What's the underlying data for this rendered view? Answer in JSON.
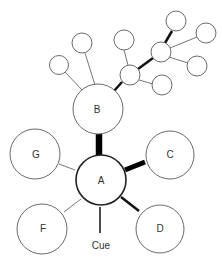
{
  "diagram": {
    "type": "network",
    "nodes": {
      "A": {
        "label": "A"
      },
      "B": {
        "label": "B"
      },
      "C": {
        "label": "C"
      },
      "D": {
        "label": "D"
      },
      "F": {
        "label": "F"
      },
      "G": {
        "label": "G"
      }
    },
    "cue_label": "Cue",
    "edges": [
      {
        "from": "A",
        "to": "B",
        "weight": "heavy"
      },
      {
        "from": "A",
        "to": "C",
        "weight": "thick"
      },
      {
        "from": "A",
        "to": "D",
        "weight": "medium"
      },
      {
        "from": "A",
        "to": "F",
        "weight": "thin"
      },
      {
        "from": "A",
        "to": "G",
        "weight": "thin"
      },
      {
        "from": "Cue",
        "to": "A",
        "weight": "medium"
      },
      {
        "from": "B",
        "to": "hub1",
        "weight": "medium"
      },
      {
        "from": "B",
        "to": "leaf1",
        "weight": "thin"
      },
      {
        "from": "B",
        "to": "leaf2",
        "weight": "thin"
      },
      {
        "from": "hub1",
        "to": "leaf3",
        "weight": "thin"
      },
      {
        "from": "hub1",
        "to": "leaf7",
        "weight": "thin"
      },
      {
        "from": "hub1",
        "to": "hub2",
        "weight": "medium"
      },
      {
        "from": "hub2",
        "to": "leaf4",
        "weight": "medium"
      },
      {
        "from": "hub2",
        "to": "leaf5",
        "weight": "thin"
      },
      {
        "from": "hub2",
        "to": "leaf6",
        "weight": "thin"
      }
    ]
  }
}
